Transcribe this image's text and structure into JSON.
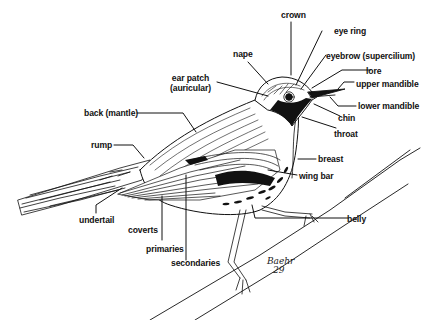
{
  "diagram": {
    "colors": {
      "ink": "#111111",
      "background": "#ffffff"
    },
    "labels": {
      "crown": "crown",
      "eye_ring": "eye ring",
      "nape": "nape",
      "eyebrow": "eyebrow (supercilium)",
      "lore": "lore",
      "ear_patch_line1": "ear patch",
      "ear_patch_line2": "(auricular)",
      "upper_mandible": "upper mandible",
      "lower_mandible": "lower mandible",
      "chin": "chin",
      "back": "back (mantle)",
      "throat": "throat",
      "rump": "rump",
      "breast": "breast",
      "wing_bar": "wing bar",
      "undertail": "undertail",
      "coverts": "coverts",
      "belly": "belly",
      "primaries": "primaries",
      "secondaries": "secondaries"
    },
    "signature": {
      "name": "Baehr",
      "year": "29"
    }
  }
}
